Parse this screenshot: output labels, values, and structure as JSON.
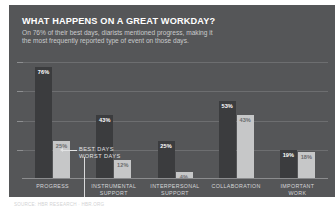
{
  "header": {
    "title": "WHAT HAPPENS ON A GREAT WORKDAY?",
    "subtitle": "On 76% of their best days, diarists mentioned progress, making it the most frequently reported type of event on those days."
  },
  "legend": {
    "best_label": "BEST DAYS",
    "worst_label": "WORST DAYS"
  },
  "colors": {
    "panel_background": "#555658",
    "best_bar": "#3b3c3e",
    "worst_bar": "#c6c7c8",
    "gridline": "#6d6e70",
    "title_text": "#ffffff",
    "subtitle_text": "#c9cacb",
    "category_text": "#d6d7d8"
  },
  "source": "SOURCE: HBR RESEARCH  ·  HBR.ORG",
  "chart_data": {
    "type": "bar",
    "title": "WHAT HAPPENS ON A GREAT WORKDAY?",
    "xlabel": "",
    "ylabel": "",
    "ylim": [
      0,
      80
    ],
    "grid": true,
    "legend_position": "inside-left",
    "categories": [
      "PROGRESS",
      "INSTRUMENTAL SUPPORT",
      "INTERPERSONAL SUPPORT",
      "COLLABORATION",
      "IMPORTANT WORK"
    ],
    "category_lines": [
      [
        "PROGRESS"
      ],
      [
        "INSTRUMENTAL",
        "SUPPORT"
      ],
      [
        "INTERPERSONAL",
        "SUPPORT"
      ],
      [
        "COLLABORATION"
      ],
      [
        "IMPORTANT",
        "WORK"
      ]
    ],
    "series": [
      {
        "name": "BEST DAYS",
        "color": "#3b3c3e",
        "values": [
          76,
          43,
          25,
          53,
          19
        ],
        "labels": [
          "76%",
          "43%",
          "25%",
          "53%",
          "19%"
        ]
      },
      {
        "name": "WORST DAYS",
        "color": "#c6c7c8",
        "values": [
          25,
          12,
          4,
          43,
          18
        ],
        "labels": [
          "25%",
          "12%",
          "4%",
          "43%",
          "18%"
        ]
      }
    ]
  }
}
